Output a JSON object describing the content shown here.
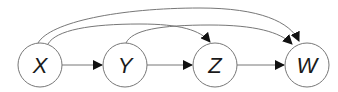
{
  "diagram": {
    "type": "directed-acyclic-graph",
    "nodes": [
      {
        "id": "X",
        "label": "X",
        "cx": 40,
        "cy": 65
      },
      {
        "id": "Y",
        "label": "Y",
        "cx": 125,
        "cy": 65
      },
      {
        "id": "Z",
        "label": "Z",
        "cx": 215,
        "cy": 65
      },
      {
        "id": "W",
        "label": "W",
        "cx": 307,
        "cy": 65
      }
    ],
    "edges": [
      {
        "from": "X",
        "to": "Y",
        "style": "straight"
      },
      {
        "from": "Y",
        "to": "Z",
        "style": "straight"
      },
      {
        "from": "Z",
        "to": "W",
        "style": "straight"
      },
      {
        "from": "X",
        "to": "Z",
        "style": "curved"
      },
      {
        "from": "X",
        "to": "W",
        "style": "curved"
      },
      {
        "from": "Y",
        "to": "W",
        "style": "curved"
      }
    ],
    "colors": {
      "stroke": "#777777",
      "arrow": "#111111",
      "node_fill": "#ffffff",
      "label": "#1a1a1a"
    }
  }
}
